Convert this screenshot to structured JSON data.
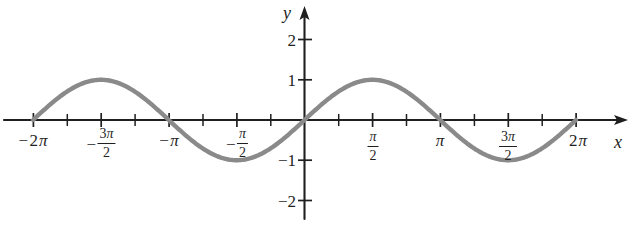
{
  "figure": {
    "title": "",
    "axis_labels": {
      "x": "x",
      "y": "y"
    },
    "curve_color": "#8a8a8a",
    "axis_color": "#1f1f1f"
  },
  "x_ticks": [
    {
      "value": -6.2832,
      "label": "−2π",
      "type": "plain",
      "sign": "−",
      "whole": "2",
      "pi": "π"
    },
    {
      "value": -4.7124,
      "label": "−3π/2",
      "type": "fraction",
      "sign": "−",
      "num": "3π",
      "den": "2"
    },
    {
      "value": -3.1416,
      "label": "−π",
      "type": "plain",
      "sign": "−",
      "whole": "",
      "pi": "π"
    },
    {
      "value": -1.5708,
      "label": "−π/2",
      "type": "fraction",
      "sign": "−",
      "num": "π",
      "den": "2"
    },
    {
      "value": 1.5708,
      "label": "π/2",
      "type": "fraction",
      "sign": "",
      "num": "π",
      "den": "2"
    },
    {
      "value": 3.1416,
      "label": "π",
      "type": "plain",
      "sign": "",
      "whole": "",
      "pi": "π"
    },
    {
      "value": 4.7124,
      "label": "3π/2",
      "type": "fraction",
      "sign": "",
      "num": "3π",
      "den": "2"
    },
    {
      "value": 6.2832,
      "label": "2π",
      "type": "plain",
      "sign": "",
      "whole": "2",
      "pi": "π"
    }
  ],
  "y_ticks": [
    {
      "value": 2,
      "label": "2"
    },
    {
      "value": 1,
      "label": "1"
    },
    {
      "value": -1,
      "label": "−1"
    },
    {
      "value": -2,
      "label": "−2"
    }
  ],
  "chart_data": {
    "type": "line",
    "title": "",
    "xlabel": "x",
    "ylabel": "y",
    "xlim": [
      -7.2,
      7.6
    ],
    "ylim": [
      -2.6,
      2.6
    ],
    "grid": false,
    "legend": null,
    "series": [
      {
        "name": "y = sin x",
        "expression": "sin(x)",
        "color": "#8a8a8a",
        "domain": [
          -6.2832,
          6.2832
        ],
        "x": [
          -6.2832,
          -5.8905,
          -5.4978,
          -5.1051,
          -4.7124,
          -4.3197,
          -3.927,
          -3.5343,
          -3.1416,
          -2.7489,
          -2.3562,
          -1.9635,
          -1.5708,
          -1.1781,
          -0.7854,
          -0.3927,
          0,
          0.3927,
          0.7854,
          1.1781,
          1.5708,
          1.9635,
          2.3562,
          2.7489,
          3.1416,
          3.5343,
          3.927,
          4.3197,
          4.7124,
          5.1051,
          5.4978,
          5.8905,
          6.2832
        ],
        "y": [
          0,
          0.3827,
          0.7071,
          0.9239,
          1,
          0.9239,
          0.7071,
          0.3827,
          0,
          -0.3827,
          -0.7071,
          -0.9239,
          -1,
          -0.9239,
          -0.7071,
          -0.3827,
          0,
          0.3827,
          0.7071,
          0.9239,
          1,
          0.9239,
          0.7071,
          0.3827,
          0,
          -0.3827,
          -0.7071,
          -0.9239,
          -1,
          -0.9239,
          -0.7071,
          -0.3827,
          0
        ]
      }
    ],
    "x_tick_values": [
      -6.2832,
      -4.7124,
      -3.1416,
      -1.5708,
      1.5708,
      3.1416,
      4.7124,
      6.2832
    ],
    "x_tick_labels": [
      "−2π",
      "−3π/2",
      "−π",
      "−π/2",
      "π/2",
      "π",
      "3π/2",
      "2π"
    ],
    "x_minor_tick_values": [
      -5.4978,
      -3.927,
      -2.3562,
      -0.7854,
      0.7854,
      2.3562,
      3.927,
      5.4978
    ],
    "y_tick_values": [
      2,
      1,
      -1,
      -2
    ],
    "y_tick_labels": [
      "2",
      "1",
      "−1",
      "−2"
    ],
    "maxima": [
      {
        "x": -4.7124,
        "y": 1
      },
      {
        "x": 1.5708,
        "y": 1
      }
    ],
    "minima": [
      {
        "x": -1.5708,
        "y": -1
      },
      {
        "x": 4.7124,
        "y": -1
      }
    ],
    "zeros": [
      -6.2832,
      -3.1416,
      0,
      3.1416,
      6.2832
    ]
  }
}
